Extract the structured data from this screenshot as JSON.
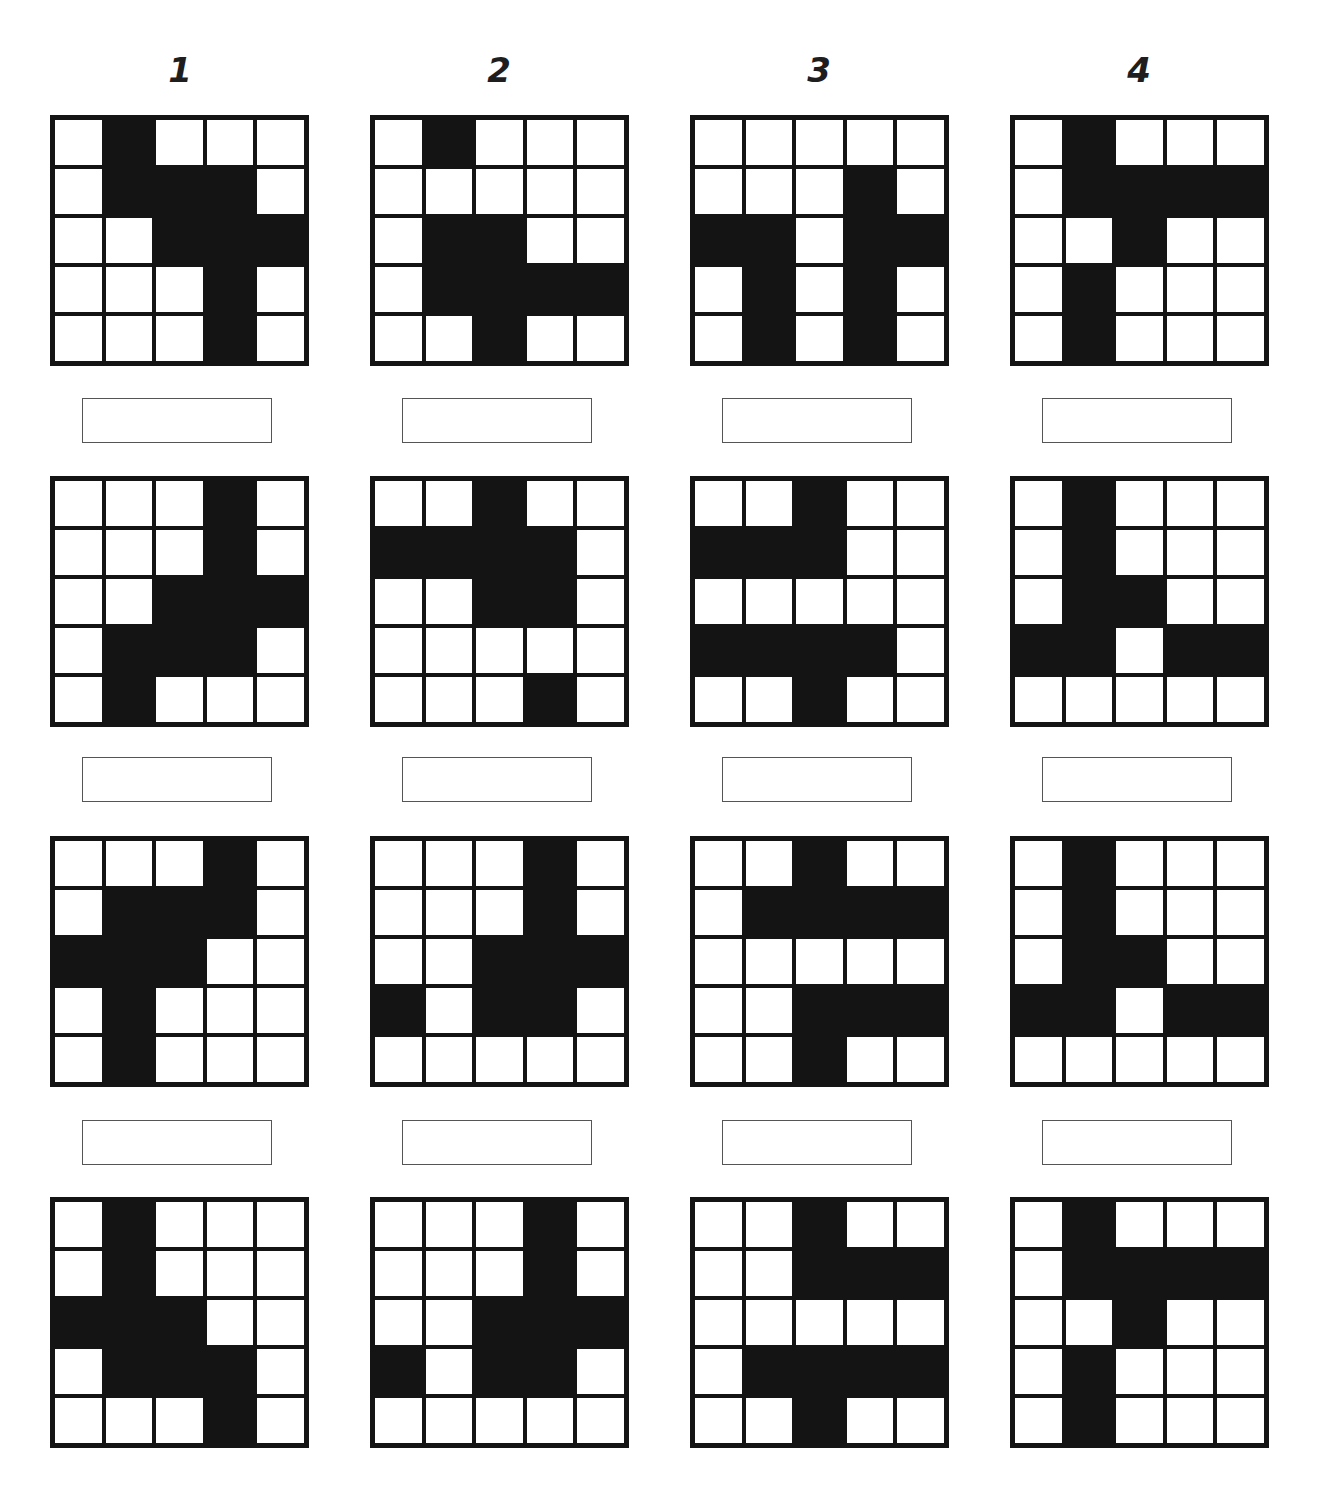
{
  "columns": [
    {
      "label": "1"
    },
    {
      "label": "2"
    },
    {
      "label": "3"
    },
    {
      "label": "4"
    }
  ],
  "rows": [
    {
      "grids": [
        [
          [
            0,
            1,
            0,
            0,
            0
          ],
          [
            0,
            1,
            1,
            1,
            0
          ],
          [
            0,
            0,
            1,
            1,
            1
          ],
          [
            0,
            0,
            0,
            1,
            0
          ],
          [
            0,
            0,
            0,
            1,
            0
          ]
        ],
        [
          [
            0,
            1,
            0,
            0,
            0
          ],
          [
            0,
            0,
            0,
            0,
            0
          ],
          [
            0,
            1,
            1,
            0,
            0
          ],
          [
            0,
            1,
            1,
            1,
            1
          ],
          [
            0,
            0,
            1,
            0,
            0
          ]
        ],
        [
          [
            0,
            0,
            0,
            0,
            0
          ],
          [
            0,
            0,
            0,
            1,
            0
          ],
          [
            1,
            1,
            0,
            1,
            1
          ],
          [
            0,
            1,
            0,
            1,
            0
          ],
          [
            0,
            1,
            0,
            1,
            0
          ]
        ],
        [
          [
            0,
            1,
            0,
            0,
            0
          ],
          [
            0,
            1,
            1,
            1,
            1
          ],
          [
            0,
            0,
            1,
            0,
            0
          ],
          [
            0,
            1,
            0,
            0,
            0
          ],
          [
            0,
            1,
            0,
            0,
            0
          ]
        ]
      ],
      "answers": [
        "",
        "",
        "",
        ""
      ]
    },
    {
      "grids": [
        [
          [
            0,
            0,
            0,
            1,
            0
          ],
          [
            0,
            0,
            0,
            1,
            0
          ],
          [
            0,
            0,
            1,
            1,
            1
          ],
          [
            0,
            1,
            1,
            1,
            0
          ],
          [
            0,
            1,
            0,
            0,
            0
          ]
        ],
        [
          [
            0,
            0,
            1,
            0,
            0
          ],
          [
            1,
            1,
            1,
            1,
            0
          ],
          [
            0,
            0,
            1,
            1,
            0
          ],
          [
            0,
            0,
            0,
            0,
            0
          ],
          [
            0,
            0,
            0,
            1,
            0
          ]
        ],
        [
          [
            0,
            0,
            1,
            0,
            0
          ],
          [
            1,
            1,
            1,
            0,
            0
          ],
          [
            0,
            0,
            0,
            0,
            0
          ],
          [
            1,
            1,
            1,
            1,
            0
          ],
          [
            0,
            0,
            1,
            0,
            0
          ]
        ],
        [
          [
            0,
            1,
            0,
            0,
            0
          ],
          [
            0,
            1,
            0,
            0,
            0
          ],
          [
            0,
            1,
            1,
            0,
            0
          ],
          [
            1,
            1,
            0,
            1,
            1
          ],
          [
            0,
            0,
            0,
            0,
            0
          ]
        ]
      ],
      "answers": [
        "",
        "",
        "",
        ""
      ]
    },
    {
      "grids": [
        [
          [
            0,
            0,
            0,
            1,
            0
          ],
          [
            0,
            1,
            1,
            1,
            0
          ],
          [
            1,
            1,
            1,
            0,
            0
          ],
          [
            0,
            1,
            0,
            0,
            0
          ],
          [
            0,
            1,
            0,
            0,
            0
          ]
        ],
        [
          [
            0,
            0,
            0,
            1,
            0
          ],
          [
            0,
            0,
            0,
            1,
            0
          ],
          [
            0,
            0,
            1,
            1,
            1
          ],
          [
            1,
            0,
            1,
            1,
            0
          ],
          [
            0,
            0,
            0,
            0,
            0
          ]
        ],
        [
          [
            0,
            0,
            1,
            0,
            0
          ],
          [
            0,
            1,
            1,
            1,
            1
          ],
          [
            0,
            0,
            0,
            0,
            0
          ],
          [
            0,
            0,
            1,
            1,
            1
          ],
          [
            0,
            0,
            1,
            0,
            0
          ]
        ],
        [
          [
            0,
            1,
            0,
            0,
            0
          ],
          [
            0,
            1,
            0,
            0,
            0
          ],
          [
            0,
            1,
            1,
            0,
            0
          ],
          [
            1,
            1,
            0,
            1,
            1
          ],
          [
            0,
            0,
            0,
            0,
            0
          ]
        ]
      ],
      "answers": [
        "",
        "",
        "",
        ""
      ]
    },
    {
      "grids": [
        [
          [
            0,
            1,
            0,
            0,
            0
          ],
          [
            0,
            1,
            0,
            0,
            0
          ],
          [
            1,
            1,
            1,
            0,
            0
          ],
          [
            0,
            1,
            1,
            1,
            0
          ],
          [
            0,
            0,
            0,
            1,
            0
          ]
        ],
        [
          [
            0,
            0,
            0,
            1,
            0
          ],
          [
            0,
            0,
            0,
            1,
            0
          ],
          [
            0,
            0,
            1,
            1,
            1
          ],
          [
            1,
            0,
            1,
            1,
            0
          ],
          [
            0,
            0,
            0,
            0,
            0
          ]
        ],
        [
          [
            0,
            0,
            1,
            0,
            0
          ],
          [
            0,
            0,
            1,
            1,
            1
          ],
          [
            0,
            0,
            0,
            0,
            0
          ],
          [
            0,
            1,
            1,
            1,
            1
          ],
          [
            0,
            0,
            1,
            0,
            0
          ]
        ],
        [
          [
            0,
            1,
            0,
            0,
            0
          ],
          [
            0,
            1,
            1,
            1,
            1
          ],
          [
            0,
            0,
            1,
            0,
            0
          ],
          [
            0,
            1,
            0,
            0,
            0
          ],
          [
            0,
            1,
            0,
            0,
            0
          ]
        ]
      ],
      "answers": null
    }
  ]
}
